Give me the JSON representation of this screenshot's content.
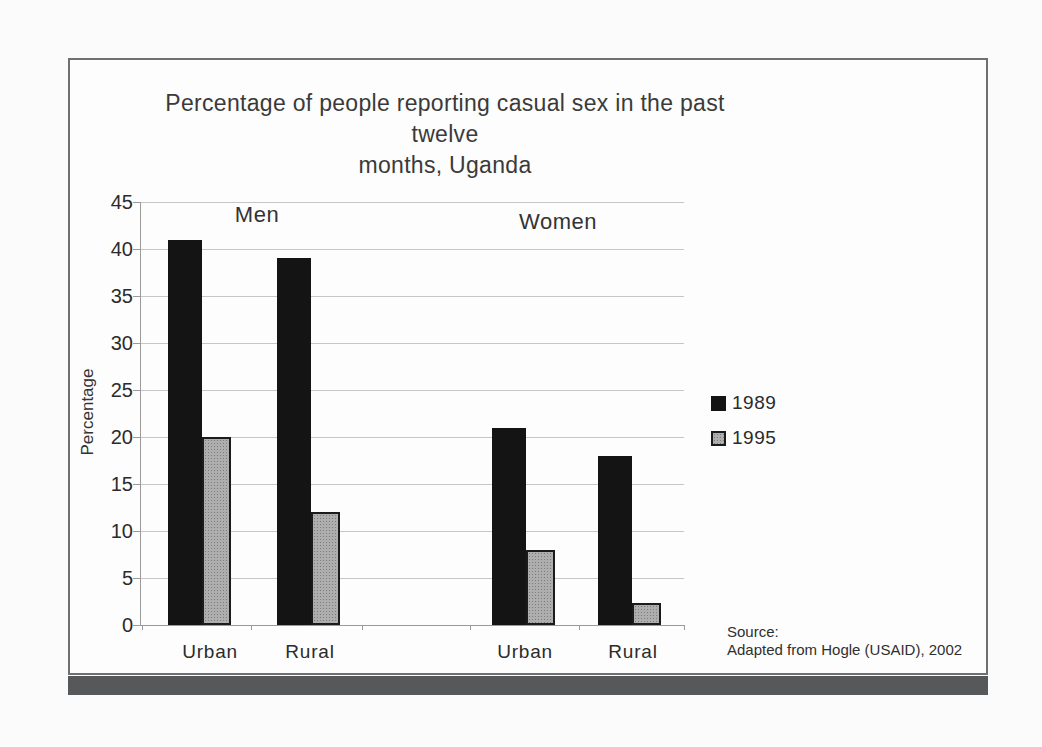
{
  "page": {
    "background": "#fbfbfb",
    "frame_border_color": "#707070",
    "bottom_bar_color": "#57585a"
  },
  "chart_data": {
    "type": "bar",
    "title": "Percentage of people reporting casual sex in the past twelve months, Uganda",
    "title_lines": [
      "Percentage of people reporting casual sex in the past twelve",
      "months, Uganda"
    ],
    "ylabel": "Percentage",
    "xlabel": "",
    "ylim": [
      0,
      45
    ],
    "ytick_step": 5,
    "yticks": [
      0,
      5,
      10,
      15,
      20,
      25,
      30,
      35,
      40,
      45
    ],
    "grid": true,
    "group_headers": [
      "Men",
      "Women"
    ],
    "categories": [
      "Urban",
      "Rural",
      "Urban",
      "Rural"
    ],
    "series": [
      {
        "name": "1989",
        "color": "#141414",
        "values": [
          41,
          39,
          21,
          18
        ]
      },
      {
        "name": "1995",
        "color": "#aeaeae",
        "values": [
          20,
          12,
          8,
          2.3
        ]
      }
    ],
    "legend": {
      "position": "right",
      "entries": [
        "1989",
        "1995"
      ]
    },
    "source": {
      "label": "Source:",
      "text": "Adapted from Hogle (USAID), 2002"
    }
  }
}
